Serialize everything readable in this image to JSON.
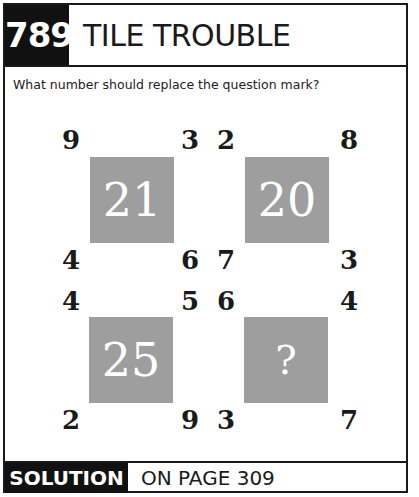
{
  "header": {
    "puzzle_number": "789",
    "title": "TILE TROUBLE"
  },
  "question": "What number should replace the question mark?",
  "tiles": [
    {
      "center": "21",
      "top_left": "9",
      "top_right": "3",
      "bottom_left": "4",
      "bottom_right": "6"
    },
    {
      "center": "20",
      "top_left": "2",
      "top_right": "8",
      "bottom_left": "7",
      "bottom_right": "3"
    },
    {
      "center": "25",
      "top_left": "4",
      "top_right": "5",
      "bottom_left": "2",
      "bottom_right": "9"
    },
    {
      "center": "?",
      "top_left": "6",
      "top_right": "4",
      "bottom_left": "3",
      "bottom_right": "7"
    }
  ],
  "footer": {
    "solution_label": "SOLUTION",
    "solution_text": "ON PAGE 309"
  },
  "colors": {
    "tile_fill": "#9e9e9e",
    "label_box": "#111111",
    "text": "#1a1a1a"
  }
}
